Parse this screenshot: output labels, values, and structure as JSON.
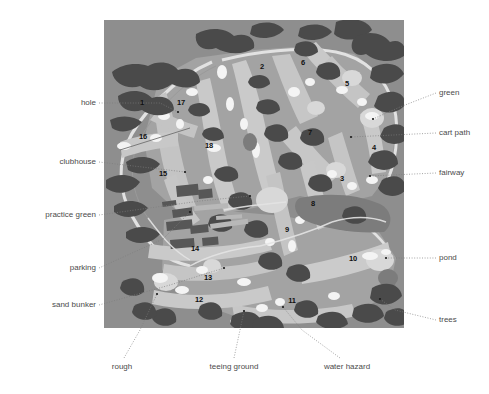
{
  "figure": {
    "kind": "golf-course-map"
  },
  "map": {
    "background_color": "#8e8e8e",
    "palette": {
      "rough_base": "#8e8e8e",
      "rough_light": "#a6a6a6",
      "fairway": "#c2c2c2",
      "fairway_light": "#cfcfcf",
      "green": "#dcdcdc",
      "sand_bunker": "#f2f2f2",
      "trees": "#4f4f4f",
      "trees_dark": "#3f3f3f",
      "water": "#7a7a7a",
      "cart_path": "#e8e8e8",
      "building": "#5c5c5c"
    },
    "hole_numbers": [
      {
        "label": "1",
        "x": 142,
        "y": 103
      },
      {
        "label": "2",
        "x": 262,
        "y": 67
      },
      {
        "label": "3",
        "x": 342,
        "y": 179
      },
      {
        "label": "4",
        "x": 374,
        "y": 148
      },
      {
        "label": "5",
        "x": 347,
        "y": 84
      },
      {
        "label": "6",
        "x": 303,
        "y": 63
      },
      {
        "label": "7",
        "x": 310,
        "y": 133
      },
      {
        "label": "8",
        "x": 313,
        "y": 204
      },
      {
        "label": "9",
        "x": 287,
        "y": 230
      },
      {
        "label": "10",
        "x": 353,
        "y": 259
      },
      {
        "label": "11",
        "x": 292,
        "y": 301
      },
      {
        "label": "12",
        "x": 199,
        "y": 300
      },
      {
        "label": "13",
        "x": 208,
        "y": 278
      },
      {
        "label": "14",
        "x": 195,
        "y": 249
      },
      {
        "label": "15",
        "x": 163,
        "y": 174
      },
      {
        "label": "16",
        "x": 143,
        "y": 137
      },
      {
        "label": "17",
        "x": 181,
        "y": 103
      },
      {
        "label": "18",
        "x": 209,
        "y": 146
      }
    ]
  },
  "callouts": [
    {
      "id": "hole",
      "text": "hole",
      "side": "left",
      "text_x": 96,
      "text_y": 103,
      "line": [
        [
          99,
          103
        ],
        [
          160,
          103
        ],
        [
          178,
          112
        ]
      ]
    },
    {
      "id": "clubhouse",
      "text": "clubhouse",
      "side": "left",
      "text_x": 96,
      "text_y": 162,
      "line": [
        [
          99,
          162
        ],
        [
          185,
          172
        ]
      ]
    },
    {
      "id": "practice-green",
      "text": "practice green",
      "side": "left",
      "text_x": 96,
      "text_y": 215,
      "line": [
        [
          99,
          215
        ],
        [
          200,
          201
        ],
        [
          250,
          196
        ]
      ]
    },
    {
      "id": "parking",
      "text": "parking",
      "side": "left",
      "text_x": 96,
      "text_y": 268,
      "line": [
        [
          99,
          268
        ],
        [
          163,
          239
        ],
        [
          190,
          212
        ]
      ]
    },
    {
      "id": "sand-bunker",
      "text": "sand bunker",
      "side": "left",
      "text_x": 96,
      "text_y": 305,
      "line": [
        [
          99,
          305
        ],
        [
          170,
          285
        ],
        [
          224,
          268
        ]
      ]
    },
    {
      "id": "green",
      "text": "green",
      "side": "right",
      "text_x": 439,
      "text_y": 93,
      "line": [
        [
          436,
          93
        ],
        [
          400,
          107
        ],
        [
          373,
          119
        ]
      ]
    },
    {
      "id": "cart-path",
      "text": "cart path",
      "side": "right",
      "text_x": 439,
      "text_y": 133,
      "line": [
        [
          436,
          133
        ],
        [
          351,
          137
        ]
      ]
    },
    {
      "id": "fairway",
      "text": "fairway",
      "side": "right",
      "text_x": 439,
      "text_y": 173,
      "line": [
        [
          436,
          173
        ],
        [
          370,
          176
        ]
      ]
    },
    {
      "id": "pond",
      "text": "pond",
      "side": "right",
      "text_x": 439,
      "text_y": 258,
      "line": [
        [
          436,
          258
        ],
        [
          386,
          258
        ]
      ]
    },
    {
      "id": "trees",
      "text": "trees",
      "side": "right",
      "text_x": 439,
      "text_y": 320,
      "line": [
        [
          436,
          320
        ],
        [
          395,
          310
        ],
        [
          380,
          299
        ]
      ]
    },
    {
      "id": "rough",
      "text": "rough",
      "side": "bottom",
      "text_x": 122,
      "text_y": 363,
      "line": [
        [
          124,
          358
        ],
        [
          140,
          330
        ],
        [
          157,
          294
        ]
      ]
    },
    {
      "id": "teeing-ground",
      "text": "teeing ground",
      "side": "bottom",
      "text_x": 234,
      "text_y": 363,
      "line": [
        [
          234,
          358
        ],
        [
          240,
          330
        ],
        [
          244,
          311
        ]
      ]
    },
    {
      "id": "water-hazard",
      "text": "water hazard",
      "side": "bottom",
      "text_x": 347,
      "text_y": 363,
      "line": [
        [
          340,
          358
        ],
        [
          302,
          330
        ],
        [
          283,
          307
        ]
      ]
    }
  ]
}
